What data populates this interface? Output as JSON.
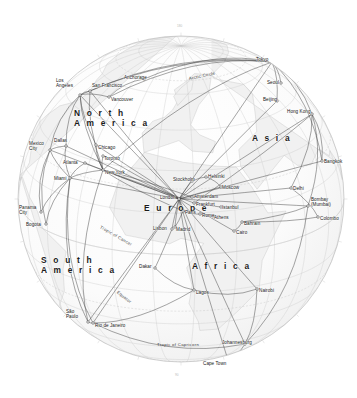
{
  "map": {
    "kind": "orthographic-globe-airline-route-map",
    "projection_center_label": "Europe",
    "background_color": "#ffffff",
    "ocean_color": "#fdfdfd",
    "land_color": "#f2f2f2",
    "coastline_color": "#b4b4b4",
    "graticule_color": "#c9c9c9",
    "globe_outline_color": "#c0c0c0",
    "route_color": "#3c3c3c",
    "hub_marker_color": "#ffffff",
    "label_color": "#161616",
    "globe": {
      "cx": 181,
      "cy": 199,
      "r": 163
    }
  },
  "continents": [
    {
      "name": "North America",
      "lines": [
        "N o r t h",
        "A m e r i c a"
      ],
      "x": 74,
      "y": 108
    },
    {
      "name": "South America",
      "lines": [
        "S o u t h",
        "A m e r i c a"
      ],
      "x": 41,
      "y": 255
    },
    {
      "name": "Europe",
      "lines": [
        "E u r o p e"
      ],
      "x": 144,
      "y": 204
    },
    {
      "name": "Africa",
      "lines": [
        "A f r i c a"
      ],
      "x": 192,
      "y": 262
    },
    {
      "name": "Asia",
      "lines": [
        "A s i a"
      ],
      "x": 252,
      "y": 134
    }
  ],
  "latitude_lines": [
    {
      "label": "Arctic Circle",
      "x": 189,
      "y": 77,
      "rotate": -12
    },
    {
      "label": "Tropic of Cancer",
      "x": 100,
      "y": 225,
      "rotate": 30
    },
    {
      "label": "Equator",
      "x": 117,
      "y": 290,
      "rotate": 38
    },
    {
      "label": "Tropic of Capricorn",
      "x": 157,
      "y": 343,
      "rotate": 0
    }
  ],
  "cities": [
    {
      "name": "Los Angeles",
      "lines": [
        "Los",
        "Angeles"
      ],
      "lx": 56,
      "ly": 79,
      "px": 80,
      "py": 95,
      "hub": true
    },
    {
      "name": "San Francisco",
      "lines": [
        "San Francisco"
      ],
      "lx": 92,
      "ly": 84,
      "px": 90,
      "py": 91,
      "hub": true
    },
    {
      "name": "Vancouver",
      "lines": [
        "Vancouver"
      ],
      "lx": 111,
      "ly": 98,
      "px": 109,
      "py": 97,
      "hub": true
    },
    {
      "name": "Anchorage",
      "lines": [
        "Anchorage"
      ],
      "lx": 124,
      "ly": 76,
      "px": 144,
      "py": 79,
      "hub": true
    },
    {
      "name": "Dallas",
      "lines": [
        "Dallas"
      ],
      "lx": 54,
      "ly": 139,
      "px": 66,
      "py": 146,
      "hub": true
    },
    {
      "name": "Mexico City",
      "lines": [
        "Mexico",
        "City"
      ],
      "lx": 29,
      "ly": 142,
      "px": 50,
      "py": 150,
      "hub": true
    },
    {
      "name": "Chicago",
      "lines": [
        "Chicago"
      ],
      "lx": 98,
      "ly": 146,
      "px": 96,
      "py": 145,
      "hub": true
    },
    {
      "name": "Toronto",
      "lines": [
        "Toronto"
      ],
      "lx": 104,
      "ly": 157,
      "px": 103,
      "py": 156,
      "hub": true
    },
    {
      "name": "Atlanta",
      "lines": [
        "Atlanta"
      ],
      "lx": 63,
      "ly": 161,
      "px": 85,
      "py": 163,
      "hub": true
    },
    {
      "name": "New York",
      "lines": [
        "New York"
      ],
      "lx": 105,
      "ly": 171,
      "px": 103,
      "py": 170,
      "hub": true
    },
    {
      "name": "Miami",
      "lines": [
        "Miami"
      ],
      "lx": 54,
      "ly": 177,
      "px": 70,
      "py": 178,
      "hub": true
    },
    {
      "name": "Panama City",
      "lines": [
        "Panama",
        "City"
      ],
      "lx": 19,
      "ly": 206,
      "px": 41,
      "py": 212,
      "hub": true
    },
    {
      "name": "Bogota",
      "lines": [
        "Bogota"
      ],
      "lx": 26,
      "ly": 223,
      "px": 46,
      "py": 224,
      "hub": true
    },
    {
      "name": "Sao Paulo",
      "lines": [
        "São",
        "Paulo"
      ],
      "lx": 66,
      "ly": 310,
      "px": 88,
      "py": 322,
      "hub": true
    },
    {
      "name": "Rio de Janeiro",
      "lines": [
        "Rio de Janeiro"
      ],
      "lx": 95,
      "ly": 324,
      "px": 93,
      "py": 323,
      "hub": true
    },
    {
      "name": "Lisbon",
      "lines": [
        "Lisbon"
      ],
      "lx": 153,
      "ly": 227,
      "px": 172,
      "py": 229,
      "hub": true
    },
    {
      "name": "Madrid",
      "lines": [
        "Madrid"
      ],
      "lx": 176,
      "ly": 228,
      "px": 175,
      "py": 227,
      "hub": true
    },
    {
      "name": "London",
      "lines": [
        "London"
      ],
      "lx": 160,
      "ly": 196,
      "px": 179,
      "py": 199,
      "hub": true
    },
    {
      "name": "Amsterdam",
      "lines": [
        "Amsterdam"
      ],
      "lx": 194,
      "ly": 195,
      "px": 192,
      "py": 197,
      "hub": true
    },
    {
      "name": "Frankfurt",
      "lines": [
        "Frankfurt"
      ],
      "lx": 196,
      "ly": 203,
      "px": 194,
      "py": 203,
      "hub": true
    },
    {
      "name": "Paris",
      "lines": [
        "Paris"
      ],
      "lx": 185,
      "ly": 211,
      "px": 183,
      "py": 211,
      "hub": true
    },
    {
      "name": "Rome",
      "lines": [
        "Rome"
      ],
      "lx": 202,
      "ly": 214,
      "px": 200,
      "py": 214,
      "hub": true
    },
    {
      "name": "Stockholm",
      "lines": [
        "Stockholm"
      ],
      "lx": 173,
      "ly": 178,
      "px": 192,
      "py": 181,
      "hub": true
    },
    {
      "name": "Helsinki",
      "lines": [
        "Helsinki"
      ],
      "lx": 208,
      "ly": 175,
      "px": 206,
      "py": 177,
      "hub": true
    },
    {
      "name": "Moscow",
      "lines": [
        "Moscow"
      ],
      "lx": 222,
      "ly": 186,
      "px": 221,
      "py": 187,
      "hub": true
    },
    {
      "name": "Istanbul",
      "lines": [
        "Istanbul"
      ],
      "lx": 222,
      "ly": 206,
      "px": 221,
      "py": 207,
      "hub": true
    },
    {
      "name": "Athens",
      "lines": [
        "Athens"
      ],
      "lx": 214,
      "ly": 216,
      "px": 213,
      "py": 216,
      "hub": true
    },
    {
      "name": "Cairo",
      "lines": [
        "Cairo"
      ],
      "lx": 236,
      "ly": 231,
      "px": 234,
      "py": 231,
      "hub": true
    },
    {
      "name": "Bahrain",
      "lines": [
        "Bahrain"
      ],
      "lx": 244,
      "ly": 222,
      "px": 242,
      "py": 222,
      "hub": true
    },
    {
      "name": "Delhi",
      "lines": [
        "Delhi"
      ],
      "lx": 293,
      "ly": 187,
      "px": 291,
      "py": 188,
      "hub": true
    },
    {
      "name": "Bombay Mumbai",
      "lines": [
        "Bombay",
        "(Mumbai)"
      ],
      "lx": 311,
      "ly": 198,
      "px": 308,
      "py": 206,
      "hub": true
    },
    {
      "name": "Colombo",
      "lines": [
        "Colombo"
      ],
      "lx": 320,
      "ly": 217,
      "px": 318,
      "py": 217,
      "hub": true
    },
    {
      "name": "Bangkok",
      "lines": [
        "Bangkok"
      ],
      "lx": 324,
      "ly": 160,
      "px": 322,
      "py": 161,
      "hub": true
    },
    {
      "name": "Hong Kong",
      "lines": [
        "Hong Kong"
      ],
      "lx": 287,
      "ly": 110,
      "px": 312,
      "py": 114,
      "hub": true
    },
    {
      "name": "Beijing",
      "lines": [
        "Beijing"
      ],
      "lx": 263,
      "ly": 98,
      "px": 277,
      "py": 101,
      "hub": true
    },
    {
      "name": "Seoul",
      "lines": [
        "Seoul"
      ],
      "lx": 267,
      "ly": 81,
      "px": 281,
      "py": 83,
      "hub": true
    },
    {
      "name": "Tokyo",
      "lines": [
        "Tokyo"
      ],
      "lx": 256,
      "ly": 58,
      "px": 272,
      "py": 62,
      "hub": true
    },
    {
      "name": "Dakar",
      "lines": [
        "Dakar"
      ],
      "lx": 139,
      "ly": 265,
      "px": 155,
      "py": 268,
      "hub": true
    },
    {
      "name": "Lagos",
      "lines": [
        "Lagos"
      ],
      "lx": 196,
      "ly": 291,
      "px": 194,
      "py": 290,
      "hub": true
    },
    {
      "name": "Nairobi",
      "lines": [
        "Nairobi"
      ],
      "lx": 259,
      "ly": 289,
      "px": 257,
      "py": 289,
      "hub": true
    },
    {
      "name": "Johannesburg",
      "lines": [
        "Johannesburg"
      ],
      "lx": 222,
      "ly": 341,
      "px": 245,
      "py": 344,
      "hub": true
    },
    {
      "name": "Cape Town",
      "lines": [
        "Cape Town"
      ],
      "lx": 203,
      "ly": 362,
      "px": 228,
      "py": 360,
      "hub": true
    }
  ],
  "graticule_ticks": [
    {
      "label": "180",
      "x": 177,
      "y": 25
    },
    {
      "label": "90",
      "x": 175,
      "y": 374
    }
  ],
  "routes": [
    {
      "from": "London",
      "to": "New York"
    },
    {
      "from": "London",
      "to": "Los Angeles"
    },
    {
      "from": "London",
      "to": "San Francisco"
    },
    {
      "from": "London",
      "to": "Chicago"
    },
    {
      "from": "London",
      "to": "Toronto"
    },
    {
      "from": "London",
      "to": "Miami"
    },
    {
      "from": "London",
      "to": "Dallas"
    },
    {
      "from": "London",
      "to": "Mexico City"
    },
    {
      "from": "London",
      "to": "Tokyo"
    },
    {
      "from": "London",
      "to": "Hong Kong"
    },
    {
      "from": "London",
      "to": "Beijing"
    },
    {
      "from": "London",
      "to": "Delhi"
    },
    {
      "from": "London",
      "to": "Bombay Mumbai"
    },
    {
      "from": "London",
      "to": "Bangkok"
    },
    {
      "from": "London",
      "to": "Johannesburg"
    },
    {
      "from": "London",
      "to": "Cape Town"
    },
    {
      "from": "London",
      "to": "Nairobi"
    },
    {
      "from": "London",
      "to": "Lagos"
    },
    {
      "from": "London",
      "to": "Rio de Janeiro"
    },
    {
      "from": "London",
      "to": "Sao Paulo"
    },
    {
      "from": "London",
      "to": "Madrid"
    },
    {
      "from": "London",
      "to": "Lisbon"
    },
    {
      "from": "London",
      "to": "Moscow"
    },
    {
      "from": "London",
      "to": "Stockholm"
    },
    {
      "from": "London",
      "to": "Cairo"
    },
    {
      "from": "New York",
      "to": "Paris"
    },
    {
      "from": "New York",
      "to": "Frankfurt"
    },
    {
      "from": "New York",
      "to": "Amsterdam"
    },
    {
      "from": "New York",
      "to": "Miami"
    },
    {
      "from": "New York",
      "to": "Chicago"
    },
    {
      "from": "New York",
      "to": "Toronto"
    },
    {
      "from": "New York",
      "to": "Atlanta"
    },
    {
      "from": "New York",
      "to": "Los Angeles"
    },
    {
      "from": "New York",
      "to": "San Francisco"
    },
    {
      "from": "New York",
      "to": "Tokyo"
    },
    {
      "from": "New York",
      "to": "Sao Paulo"
    },
    {
      "from": "Tokyo",
      "to": "Los Angeles"
    },
    {
      "from": "Tokyo",
      "to": "San Francisco"
    },
    {
      "from": "Tokyo",
      "to": "Vancouver"
    },
    {
      "from": "Tokyo",
      "to": "Anchorage"
    },
    {
      "from": "Tokyo",
      "to": "Seoul"
    },
    {
      "from": "Tokyo",
      "to": "Beijing"
    },
    {
      "from": "Tokyo",
      "to": "Hong Kong"
    },
    {
      "from": "Tokyo",
      "to": "Bangkok"
    },
    {
      "from": "Hong Kong",
      "to": "Bangkok"
    },
    {
      "from": "Hong Kong",
      "to": "Delhi"
    },
    {
      "from": "Hong Kong",
      "to": "Bombay Mumbai"
    },
    {
      "from": "Hong Kong",
      "to": "Frankfurt"
    },
    {
      "from": "Miami",
      "to": "Bogota"
    },
    {
      "from": "Miami",
      "to": "Panama City"
    },
    {
      "from": "Miami",
      "to": "Sao Paulo"
    },
    {
      "from": "Miami",
      "to": "Rio de Janeiro"
    },
    {
      "from": "Miami",
      "to": "Mexico City"
    },
    {
      "from": "Miami",
      "to": "Dallas"
    },
    {
      "from": "Miami",
      "to": "Atlanta"
    },
    {
      "from": "Rio de Janeiro",
      "to": "Johannesburg"
    },
    {
      "from": "Rio de Janeiro",
      "to": "Lagos"
    },
    {
      "from": "Rio de Janeiro",
      "to": "Sao Paulo"
    },
    {
      "from": "Johannesburg",
      "to": "Nairobi"
    },
    {
      "from": "Johannesburg",
      "to": "Cape Town"
    },
    {
      "from": "Johannesburg",
      "to": "Bombay Mumbai"
    },
    {
      "from": "Lagos",
      "to": "Nairobi"
    },
    {
      "from": "Lagos",
      "to": "Dakar"
    },
    {
      "from": "Dakar",
      "to": "Lisbon"
    },
    {
      "from": "Cairo",
      "to": "Bahrain"
    },
    {
      "from": "Bahrain",
      "to": "Bombay Mumbai"
    },
    {
      "from": "Bahrain",
      "to": "Colombo"
    },
    {
      "from": "Delhi",
      "to": "Colombo"
    },
    {
      "from": "Mexico City",
      "to": "Panama City"
    },
    {
      "from": "Mexico City",
      "to": "Bogota"
    },
    {
      "from": "Mexico City",
      "to": "Los Angeles"
    },
    {
      "from": "Mexico City",
      "to": "Dallas"
    },
    {
      "from": "Los Angeles",
      "to": "Vancouver"
    },
    {
      "from": "Los Angeles",
      "to": "San Francisco"
    },
    {
      "from": "Los Angeles",
      "to": "Dallas"
    },
    {
      "from": "Los Angeles",
      "to": "Chicago"
    },
    {
      "from": "Vancouver",
      "to": "Anchorage"
    },
    {
      "from": "Paris",
      "to": "Madrid"
    },
    {
      "from": "Paris",
      "to": "Rome"
    },
    {
      "from": "Frankfurt",
      "to": "Istanbul"
    },
    {
      "from": "Rome",
      "to": "Athens"
    },
    {
      "from": "Moscow",
      "to": "Helsinki"
    },
    {
      "from": "Stockholm",
      "to": "Helsinki"
    }
  ]
}
